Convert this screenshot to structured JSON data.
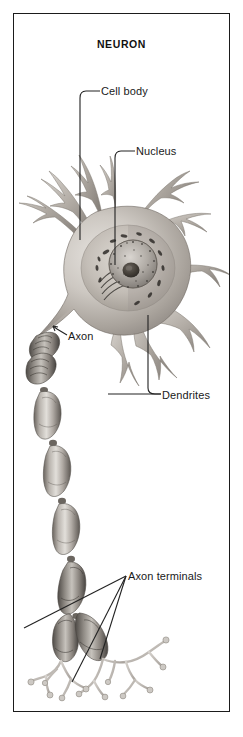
{
  "figure": {
    "title": "NEURON",
    "domain_note": "grayscale anatomical illustration of a nerve cell",
    "frame": {
      "border_color": "#1b1b1b",
      "background_color": "#ffffff"
    },
    "palette": {
      "ink": "#1a1a1a",
      "leader_line": "#222222",
      "soma_light": "#d8d4cf",
      "soma_mid": "#a9a49e",
      "soma_dark": "#6f6a65",
      "nucleus_dark": "#4a4744",
      "myelin_light": "#cbc7c2",
      "myelin_dark": "#5e5a56",
      "terminal_light": "#c9c5c0"
    }
  },
  "labels": [
    {
      "id": "cell-body",
      "text": "Cell body",
      "points_to": "soma",
      "leader": "elbow-down-left"
    },
    {
      "id": "nucleus",
      "text": "Nucleus",
      "points_to": "nucleus",
      "leader": "elbow-down-left"
    },
    {
      "id": "axon",
      "text": "Axon",
      "points_to": "axon-hillock",
      "leader": "short-diagonal"
    },
    {
      "id": "dendrites",
      "text": "Dendrites",
      "points_to": "dendrite-branches",
      "leader": "elbow-up-and-left"
    },
    {
      "id": "axon-terminals",
      "text": "Axon terminals",
      "points_to": "terminal-boutons",
      "leader": "three-ray-fan"
    }
  ],
  "structures": [
    {
      "name": "soma",
      "label": "Cell body"
    },
    {
      "name": "nucleus",
      "label": "Nucleus"
    },
    {
      "name": "dendrites",
      "label": "Dendrites"
    },
    {
      "name": "axon",
      "label": "Axon"
    },
    {
      "name": "myelin-sheath",
      "label": ""
    },
    {
      "name": "axon-terminals",
      "label": "Axon terminals"
    }
  ]
}
